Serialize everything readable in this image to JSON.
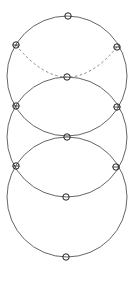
{
  "diagram": {
    "type": "stacked-circles",
    "width": 136,
    "height": 281,
    "colors": {
      "stroke": "#555555",
      "dashed": "#777777",
      "points": "#222222",
      "background": "#ffffff"
    },
    "circles": [
      {
        "name": "top-circle",
        "cx": 67,
        "cy": 76,
        "r": 60,
        "style": "solid"
      },
      {
        "name": "middle-circle",
        "cx": 67,
        "cy": 137,
        "r": 60,
        "style": "solid"
      },
      {
        "name": "bottom-circle",
        "cx": 67,
        "cy": 197,
        "r": 60,
        "style": "solid"
      }
    ],
    "hidden_arc": {
      "name": "hidden-arc",
      "cx": 67,
      "cy": 16,
      "r": 60,
      "style": "dashed",
      "from": [
        16,
        45
      ],
      "through": [
        67,
        77
      ],
      "to": [
        117,
        47
      ]
    },
    "points": [
      {
        "name": "top",
        "x": 68,
        "y": 16,
        "marker": "circle"
      },
      {
        "name": "upper-left",
        "x": 16,
        "y": 45,
        "marker": "crossed-circle"
      },
      {
        "name": "upper-right",
        "x": 117,
        "y": 47,
        "marker": "crossed-circle"
      },
      {
        "name": "upper-center",
        "x": 67,
        "y": 77,
        "marker": "circle"
      },
      {
        "name": "mid-left",
        "x": 16,
        "y": 106,
        "marker": "crossed-circle"
      },
      {
        "name": "mid-right",
        "x": 117,
        "y": 107,
        "marker": "crossed-circle"
      },
      {
        "name": "center",
        "x": 67,
        "y": 137,
        "marker": "circle"
      },
      {
        "name": "lower-left",
        "x": 16,
        "y": 166,
        "marker": "crossed-circle"
      },
      {
        "name": "lower-right",
        "x": 116,
        "y": 167,
        "marker": "crossed-circle"
      },
      {
        "name": "lower-center",
        "x": 66,
        "y": 197,
        "marker": "circle"
      },
      {
        "name": "bottom",
        "x": 66,
        "y": 257,
        "marker": "circle"
      }
    ]
  }
}
